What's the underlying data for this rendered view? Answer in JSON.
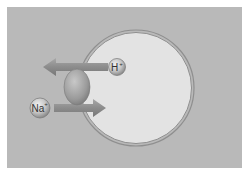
{
  "diagram": {
    "labels": {
      "proton": "H",
      "proton_charge": "+",
      "sodium": "Na",
      "sodium_charge": "+"
    },
    "colors": {
      "background": "#b9b9b9",
      "cell_fill": "#e3e3e3",
      "membrane": "#8f8f8f",
      "arrow": "#8a8a8a",
      "transporter": "#9a9a9a",
      "ion": "#bdbdbd"
    }
  }
}
